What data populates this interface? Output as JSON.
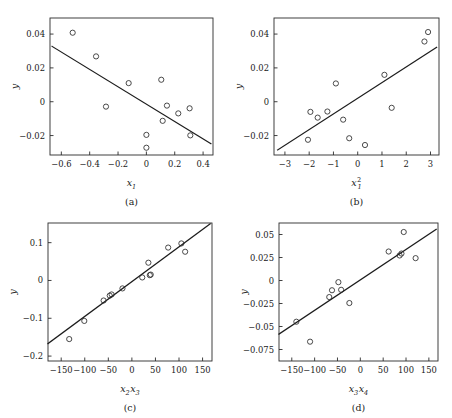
{
  "figure": {
    "width": 452,
    "height": 418,
    "background": "#ffffff",
    "line_color": "#1c1c1c",
    "marker_color": "#2b2b2b",
    "layout": "2x2 grid of partial regression scatter plots"
  },
  "chart_data": [
    {
      "type": "scatter",
      "panel": "a",
      "caption": "(a)",
      "title": "",
      "xlabel": "x₁",
      "xlabel_base": "x",
      "xlabel_sub": "1",
      "xlabel_sup": "",
      "ylabel": "y",
      "xlim": [
        -0.68,
        0.47
      ],
      "ylim": [
        -0.0315,
        0.0495
      ],
      "xticks": [
        -0.6,
        -0.4,
        -0.2,
        0,
        0.2,
        0.4
      ],
      "xticklabels": [
        "−0.6",
        "−0.4",
        "−0.2",
        "0",
        "0.2",
        "0.4"
      ],
      "yticks": [
        0.04,
        0.02,
        0,
        -0.02
      ],
      "yticklabels": [
        "0.04",
        "0.02",
        "0",
        "−0.02"
      ],
      "grid": false,
      "legend": "none",
      "x": [
        -0.52,
        -0.355,
        -0.285,
        -0.125,
        0.0,
        0.0,
        0.105,
        0.115,
        0.145,
        0.225,
        0.305,
        0.31
      ],
      "y": [
        0.0408,
        0.0268,
        -0.0029,
        0.011,
        -0.0196,
        -0.0272,
        0.013,
        -0.0113,
        -0.0023,
        -0.0069,
        -0.0039,
        -0.0199
      ],
      "fit_line": {
        "x0": -0.665,
        "y0": 0.0327,
        "x1": 0.455,
        "y1": -0.0248,
        "slope": -0.0513,
        "description": "negative-slope least squares fit"
      }
    },
    {
      "type": "scatter",
      "panel": "b",
      "caption": "(b)",
      "title": "",
      "xlabel": "x₁²",
      "xlabel_base": "x",
      "xlabel_sub": "1",
      "xlabel_sup": "2",
      "ylabel": "y",
      "xlim": [
        -3.45,
        3.35
      ],
      "ylim": [
        -0.0315,
        0.0495
      ],
      "xticks": [
        -3,
        -2,
        -1,
        0,
        1,
        2,
        3
      ],
      "xticklabels": [
        "−3",
        "−2",
        "−1",
        "0",
        "1",
        "2",
        "3"
      ],
      "yticks": [
        0.04,
        0.02,
        0,
        -0.02
      ],
      "yticklabels": [
        "0.04",
        "0.02",
        "0",
        "−0.02"
      ],
      "grid": false,
      "legend": "none",
      "x": [
        -2.05,
        -1.95,
        -1.65,
        -1.25,
        -0.9,
        -0.6,
        -0.35,
        0.3,
        1.1,
        1.4,
        2.75,
        2.9
      ],
      "y": [
        -0.0225,
        -0.006,
        -0.0094,
        -0.0058,
        0.0108,
        -0.0106,
        -0.0216,
        -0.0256,
        0.0159,
        -0.0036,
        0.0356,
        0.0412
      ],
      "fit_line": {
        "x0": -3.3,
        "y0": -0.0285,
        "x1": 3.25,
        "y1": 0.0321,
        "slope": 0.00925,
        "description": "positive-slope least squares fit"
      }
    },
    {
      "type": "scatter",
      "panel": "c",
      "caption": "(c)",
      "title": "",
      "xlabel": "x₂x₃",
      "xlabel_base": "x",
      "xlabel_sub": "2",
      "xlabel_base2": "x",
      "xlabel_sub2": "3",
      "ylabel": "y",
      "xlim": [
        -178,
        170
      ],
      "ylim": [
        -0.213,
        0.152
      ],
      "xticks": [
        -150,
        -100,
        -50,
        0,
        50,
        100,
        150
      ],
      "xticklabels": [
        "−150",
        "−100",
        "−50",
        "0",
        "50",
        "100",
        "150"
      ],
      "yticks": [
        0.1,
        0,
        -0.1,
        -0.2
      ],
      "yticklabels": [
        "0.1",
        "0",
        "−0.1",
        "−0.2"
      ],
      "grid": false,
      "legend": "none",
      "x": [
        -133,
        -101,
        -60,
        -47,
        -43,
        -20,
        22,
        35,
        38,
        40,
        77,
        105,
        113
      ],
      "y": [
        -0.155,
        -0.107,
        -0.053,
        -0.04,
        -0.037,
        -0.021,
        0.008,
        0.047,
        0.014,
        0.0155,
        0.087,
        0.098,
        0.076
      ],
      "fit_line": {
        "x0": -178,
        "y0": -0.167,
        "x1": 166,
        "y1": 0.15,
        "slope": 0.000921,
        "description": "tight positive-slope least squares fit"
      }
    },
    {
      "type": "scatter",
      "panel": "d",
      "caption": "(d)",
      "title": "",
      "xlabel": "x₃x₄",
      "xlabel_base": "x",
      "xlabel_sub": "3",
      "xlabel_base2": "x",
      "xlabel_sub2": "4",
      "ylabel": "y",
      "xlim": [
        -178,
        170
      ],
      "ylim": [
        -0.0875,
        0.0625
      ],
      "xticks": [
        -150,
        -100,
        -50,
        0,
        50,
        100,
        150
      ],
      "xticklabels": [
        "−150",
        "−100",
        "−50",
        "0",
        "50",
        "100",
        "150"
      ],
      "yticks": [
        0.05,
        0.025,
        0,
        -0.025,
        -0.05,
        -0.075
      ],
      "yticklabels": [
        "0.05",
        "0.025",
        "0",
        "−0.025",
        "−0.05",
        "−0.075"
      ],
      "grid": false,
      "legend": "none",
      "x": [
        -140,
        -110,
        -68,
        -62,
        -48,
        -42,
        -24,
        62,
        86,
        90,
        95,
        121
      ],
      "y": [
        -0.0448,
        -0.0665,
        -0.018,
        -0.0106,
        -0.0018,
        -0.0101,
        -0.0245,
        0.0315,
        0.0272,
        0.0293,
        0.0527,
        0.0243
      ],
      "fit_line": {
        "x0": -178,
        "y0": -0.0583,
        "x1": 166,
        "y1": 0.0555,
        "slope": 0.000331,
        "description": "positive-slope least squares fit"
      }
    }
  ]
}
